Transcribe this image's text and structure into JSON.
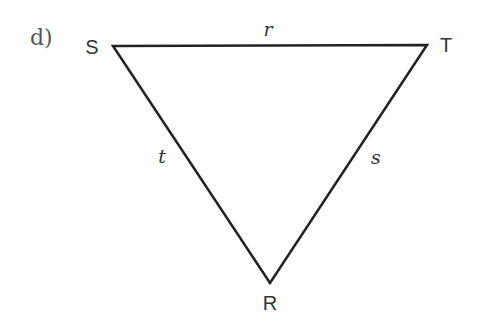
{
  "part": "d)",
  "triangle": {
    "vertices": {
      "S": {
        "label": "S",
        "x": 113,
        "y": 46,
        "label_x": 92,
        "label_y": 47
      },
      "T": {
        "label": "T",
        "x": 427,
        "y": 45,
        "label_x": 446,
        "label_y": 45
      },
      "R": {
        "label": "R",
        "x": 270,
        "y": 283,
        "label_x": 270,
        "label_y": 303
      }
    },
    "sides": {
      "r": {
        "label": "r",
        "between": "S-T",
        "label_x": 268,
        "label_y": 29
      },
      "t": {
        "label": "t",
        "between": "S-R",
        "label_x": 162,
        "label_y": 156
      },
      "s": {
        "label": "s",
        "between": "T-R",
        "label_x": 376,
        "label_y": 157
      }
    },
    "stroke_color": "#222222",
    "stroke_width": 2.5
  }
}
